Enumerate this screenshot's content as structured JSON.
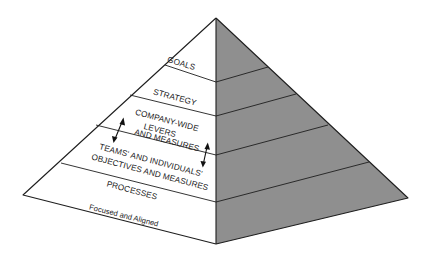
{
  "diagram": {
    "type": "pyramid",
    "colors": {
      "left_face": "#ffffff",
      "right_face": "#8f8f8f",
      "outline": "#1e1e1e"
    },
    "layers": [
      {
        "label_lines": [
          "GOALS"
        ]
      },
      {
        "label_lines": [
          "STRATEGY"
        ]
      },
      {
        "label_lines": [
          "COMPANY-WIDE",
          "LEVERS",
          "AND MEASURES"
        ]
      },
      {
        "label_lines": [
          "TEAMS' AND INDIVIDUALS'",
          "OBJECTIVES AND MEASURES"
        ]
      },
      {
        "label_lines": [
          "PROCESSES"
        ]
      }
    ],
    "base_label": "Focused and Aligned",
    "arrows": [
      {
        "type": "double-headed",
        "between": [
          "COMPANY-WIDE LEVERS AND MEASURES",
          "TEAMS' AND INDIVIDUALS' OBJECTIVES AND MEASURES"
        ],
        "side": "left"
      },
      {
        "type": "double-headed",
        "between": [
          "COMPANY-WIDE LEVERS AND MEASURES",
          "TEAMS' AND INDIVIDUALS' OBJECTIVES AND MEASURES"
        ],
        "side": "right"
      }
    ]
  }
}
